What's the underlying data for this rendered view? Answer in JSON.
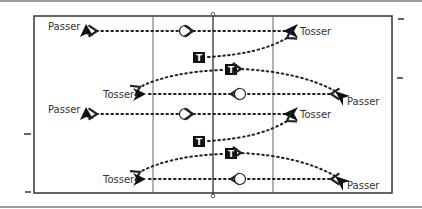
{
  "diagram": {
    "colors": {
      "line": "#222222",
      "divider": "#555555",
      "frame": "#888888",
      "label": "#333333"
    },
    "labels": {
      "passer": "Passer",
      "tosser": "Tosser",
      "target": "T"
    },
    "groups": [
      {
        "name": "upper",
        "left_passer_label": "Passer",
        "right_tosser_label": "Tosser",
        "left_tosser_label": "Tosser",
        "right_passer_label": "Passer",
        "target_1": "T",
        "target_2": "T"
      },
      {
        "name": "lower",
        "left_passer_label": "Passer",
        "right_tosser_label": "Tosser",
        "left_tosser_label": "Tosser",
        "right_passer_label": "Passer",
        "target_1": "T",
        "target_2": "T"
      }
    ]
  }
}
